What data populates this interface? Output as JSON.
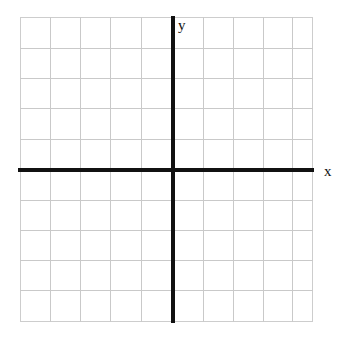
{
  "figure": {
    "kind": "cartesian-coordinate-plane",
    "title": "",
    "background_color": "#ffffff",
    "grid_color": "#c9c9c9",
    "border_color": "#cdcdcd",
    "axis_color": "#111111"
  },
  "labels": {
    "x_axis": "x",
    "y_axis": "y"
  },
  "chart_data": {
    "type": "scatter",
    "title": "",
    "xlabel": "x",
    "ylabel": "y",
    "grid": true,
    "legend": null,
    "xlim": [
      -5,
      4.6
    ],
    "ylim": [
      -5,
      5
    ],
    "xticks": [],
    "yticks": [],
    "series": [],
    "annotations": []
  },
  "grid": {
    "columns_left_of_y_axis": 5,
    "columns_right_of_y_axis": 5,
    "rows_above_x_axis": 5,
    "rows_below_x_axis": 5,
    "cell_size_px": 30,
    "vertical_line_offsets": [
      30,
      60,
      90,
      121,
      183,
      213,
      243,
      272
    ],
    "horizontal_line_offsets": [
      31,
      61,
      91,
      122,
      183,
      213,
      243,
      273
    ]
  }
}
